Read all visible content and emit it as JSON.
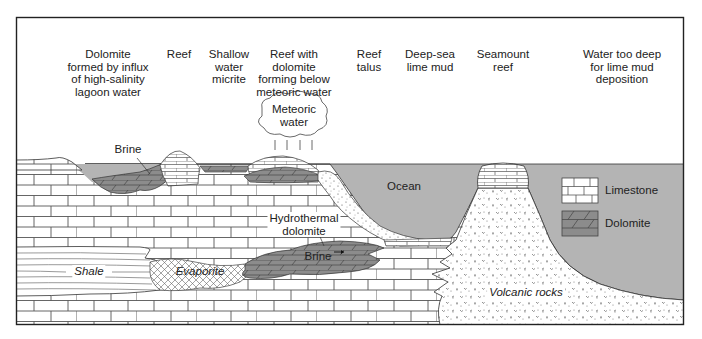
{
  "diagram": {
    "title_labels": [
      {
        "id": "dolomite-lagoon",
        "text": "Dolomite\nformed by influx\nof high-salinity\nlagoon water",
        "x": 108,
        "y": 48
      },
      {
        "id": "reef",
        "text": "Reef",
        "x": 179,
        "y": 48
      },
      {
        "id": "shallow-water-micrite",
        "text": "Shallow\nwater\nmicrite",
        "x": 229,
        "y": 48
      },
      {
        "id": "reef-with-dolomite",
        "text": "Reef with\ndolomite\nforming below\nmeteoric water",
        "x": 294,
        "y": 48
      },
      {
        "id": "reef-talus",
        "text": "Reef\ntalus",
        "x": 369,
        "y": 48
      },
      {
        "id": "deep-sea-lime-mud",
        "text": "Deep-sea\nlime mud",
        "x": 430,
        "y": 48
      },
      {
        "id": "seamount-reef",
        "text": "Seamount\nreef",
        "x": 503,
        "y": 48
      },
      {
        "id": "water-too-deep",
        "text": "Water too deep\nfor lime mud\ndeposition",
        "x": 622,
        "y": 48
      }
    ],
    "inline_labels": {
      "meteoric_water": "Meteoric\nwater",
      "brine_upper": "Brine",
      "ocean": "Ocean",
      "hydrothermal_dolomite": "Hydrothermal\ndolomite",
      "brine_lower": "Brine",
      "shale": "Shale",
      "evaporite": "Evaporite",
      "volcanic_rocks": "Volcanic rocks"
    },
    "legend": {
      "items": [
        {
          "label": "Limestone",
          "pattern": "limestone-brick"
        },
        {
          "label": "Dolomite",
          "pattern": "dolomite-brick"
        }
      ]
    },
    "colors": {
      "ocean": "#b4b4b4",
      "dolomite": "#8c8c8c",
      "line": "#333333",
      "frame": "#222222",
      "background": "#ffffff"
    }
  }
}
